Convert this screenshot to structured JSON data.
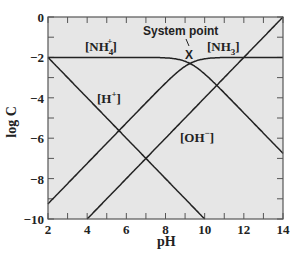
{
  "chart_data": {
    "type": "line",
    "title": "",
    "xlabel": "pH",
    "ylabel": "log C",
    "xlim": [
      2,
      14
    ],
    "ylim": [
      -10,
      0
    ],
    "xticks": [
      2,
      4,
      6,
      8,
      10,
      12,
      14
    ],
    "yticks": [
      0,
      -2,
      -4,
      -6,
      -8,
      -10
    ],
    "grid": false,
    "background": "#e6e6e6",
    "line_color": "#222222",
    "pKa": 9.25,
    "total_concentration_log": -2,
    "series": [
      {
        "name": "[H+]",
        "label": "[H⁺]",
        "x": [
          2,
          10
        ],
        "y": [
          -2,
          -10
        ]
      },
      {
        "name": "[OH-]",
        "label": "[OH⁻]",
        "x": [
          4,
          14
        ],
        "y": [
          -10,
          0
        ]
      },
      {
        "name": "[NH4+]",
        "label": "[NH₄⁺]",
        "x": [
          2,
          8,
          9.25,
          10,
          12,
          14
        ],
        "y": [
          -2,
          -2.02,
          -2.3,
          -2.82,
          -4.75,
          -6.75
        ]
      },
      {
        "name": "[NH3]",
        "label": "[NH₃]",
        "x": [
          2,
          6,
          8,
          9.25,
          10,
          12,
          14
        ],
        "y": [
          -9.25,
          -5.25,
          -3.27,
          -2.3,
          -2.07,
          -2.0,
          -2.0
        ]
      }
    ],
    "annotations": [
      {
        "text": "System point",
        "x": 9.25,
        "y": -2.3,
        "marker": "X"
      }
    ]
  },
  "labels": {
    "xlabel": "pH",
    "ylabel": "log C",
    "system_point": "System point",
    "marker": "X",
    "nh4": "[NH",
    "nh4_sub": "4",
    "nh4_sup": "+",
    "nh4_close": "]",
    "nh3": "[NH",
    "nh3_sub": "3",
    "nh3_close": "]",
    "h": "[H",
    "h_sup": "+",
    "h_close": "]",
    "oh": "[OH",
    "oh_sup": "−",
    "oh_close": "]"
  }
}
